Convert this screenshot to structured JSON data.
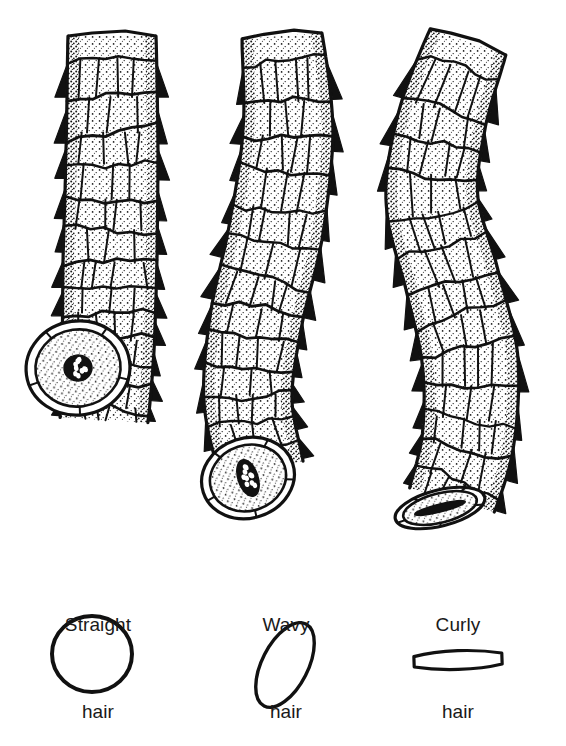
{
  "figure": {
    "kind": "scientific-illustration",
    "background_color": "#ffffff",
    "ink_color": "#111111",
    "width": 566,
    "height": 746
  },
  "specimens": [
    {
      "id": "straight",
      "label_line1": "Straight",
      "label_line2": "hair",
      "caption_center_x": 98,
      "shaft": {
        "description": "straight cylindrical hair shaft with imbricated cuticle scales",
        "axis_points": [
          [
            112,
            36
          ],
          [
            112,
            150
          ],
          [
            110,
            260
          ],
          [
            108,
            350
          ],
          [
            104,
            420
          ]
        ],
        "half_width": [
          44,
          46,
          47,
          46,
          44
        ],
        "tip_style": "flat-cut",
        "curvature": "none"
      },
      "cut_end": {
        "shape": "circle",
        "center": [
          78,
          368
        ],
        "rx": 52,
        "ry": 47,
        "rotation": -8,
        "medulla": {
          "shape": "round",
          "center": [
            78,
            371
          ],
          "rx": 14,
          "ry": 13,
          "speck_count": 9
        }
      },
      "cross_section": {
        "shape": "circle",
        "center": [
          92,
          654
        ],
        "rx": 40,
        "ry": 38,
        "rotation": 0,
        "stroke_width": 4
      }
    },
    {
      "id": "wavy",
      "label_line1": "Wavy",
      "label_line2": "hair",
      "caption_center_x": 286,
      "shaft": {
        "description": "gently undulating hair shaft with imbricated cuticle scales",
        "axis_points": [
          [
            282,
            36
          ],
          [
            288,
            130
          ],
          [
            276,
            230
          ],
          [
            256,
            320
          ],
          [
            248,
            400
          ],
          [
            262,
            470
          ]
        ],
        "half_width": [
          40,
          45,
          47,
          46,
          44,
          42
        ],
        "tip_style": "flat-cut",
        "curvature": "slight-wave"
      },
      "cut_end": {
        "shape": "oval",
        "center": [
          248,
          478
        ],
        "rx": 47,
        "ry": 40,
        "rotation": -18,
        "medulla": {
          "shape": "oval",
          "center": [
            248,
            479
          ],
          "rx": 10,
          "ry": 19,
          "speck_count": 10
        }
      },
      "cross_section": {
        "shape": "ellipse",
        "center": [
          285,
          665
        ],
        "rx": 23,
        "ry": 46,
        "rotation": 27,
        "stroke_width": 3.4
      }
    },
    {
      "id": "curly",
      "label_line1": "Curly",
      "label_line2": "hair",
      "caption_center_x": 458,
      "shaft": {
        "description": "strongly S-curved hair shaft with prominent protruding cuticle scales",
        "axis_points": [
          [
            468,
            42
          ],
          [
            442,
            120
          ],
          [
            432,
            200
          ],
          [
            452,
            280
          ],
          [
            470,
            360
          ],
          [
            468,
            440
          ],
          [
            452,
            500
          ]
        ],
        "half_width": [
          40,
          44,
          46,
          47,
          48,
          46,
          44
        ],
        "tip_style": "torn-angled",
        "curvature": "strong-s-curve"
      },
      "cut_end": {
        "shape": "flattened-ribbon",
        "center": [
          440,
          508
        ],
        "rx": 46,
        "ry": 18,
        "rotation": -14,
        "medulla": {
          "shape": "slit",
          "center": [
            438,
            508
          ],
          "rx": 26,
          "ry": 4,
          "speck_count": 0
        }
      },
      "cross_section": {
        "shape": "ribbon",
        "center": [
          458,
          660
        ],
        "rx": 44,
        "ry": 11,
        "rotation": -2,
        "stroke_width": 3.2
      }
    }
  ],
  "rendering": {
    "scale_rows_per_shaft": 13,
    "scale_columns": 3,
    "stipple_density": 0.55,
    "scale_edge_teeth": 11,
    "outline_width": 3.2,
    "scale_line_width": 2.2
  }
}
